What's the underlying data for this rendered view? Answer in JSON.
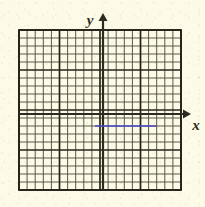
{
  "figure": {
    "background_color": "#fdfbe8",
    "type": "coordinate-grid-with-segment",
    "axes": {
      "y_axis": {
        "label": "y",
        "label_x": 90,
        "label_y": 25,
        "arrow_direction": "up",
        "line_x": 103,
        "arrow_tip_y": 13,
        "line_bottom_y": 190,
        "color": "#2b2b22"
      },
      "x_axis": {
        "label": "x",
        "label_x": 196,
        "label_y": 130,
        "arrow_direction": "right",
        "line_y": 114,
        "arrow_tip_x": 191,
        "line_left_x": 19,
        "color": "#2b2b22"
      }
    },
    "grid": {
      "left": 19,
      "top": 30,
      "right": 181,
      "bottom": 190,
      "columns": 20,
      "rows": 20,
      "cell_width": 8.1,
      "cell_height": 8.0,
      "minor_color": "#4a4638",
      "major_color": "#262219",
      "major_every": 5,
      "minor_width": 0.9,
      "major_width": 1.7,
      "border_color": "#262219",
      "border_width": 1.8
    },
    "segments": [
      {
        "name": "blue-horizontal-segment",
        "color": "#4a4ac8",
        "x_start": 95,
        "x_end": 156,
        "y": 126,
        "width": 1.6,
        "orientation": "horizontal"
      }
    ]
  },
  "chart_data": {
    "type": "line",
    "title": "",
    "xlabel": "x",
    "ylabel": "y",
    "xlim": [
      -10.4,
      9.6
    ],
    "ylim": [
      -9.5,
      10.5
    ],
    "grid": true,
    "legend": null,
    "series": [
      {
        "name": "blue-segment",
        "color": "#4a4ac8",
        "x": [
          -1.0,
          6.5
        ],
        "y": [
          -1.5,
          -1.5
        ],
        "description": "horizontal segment one and a half units below the x-axis"
      }
    ],
    "annotations": [
      {
        "text": "y",
        "kind": "axis-arrow-label",
        "position": "top of vertical axis"
      },
      {
        "text": "x",
        "kind": "axis-arrow-label",
        "position": "right of horizontal axis"
      }
    ],
    "xticks": [],
    "yticks": []
  }
}
